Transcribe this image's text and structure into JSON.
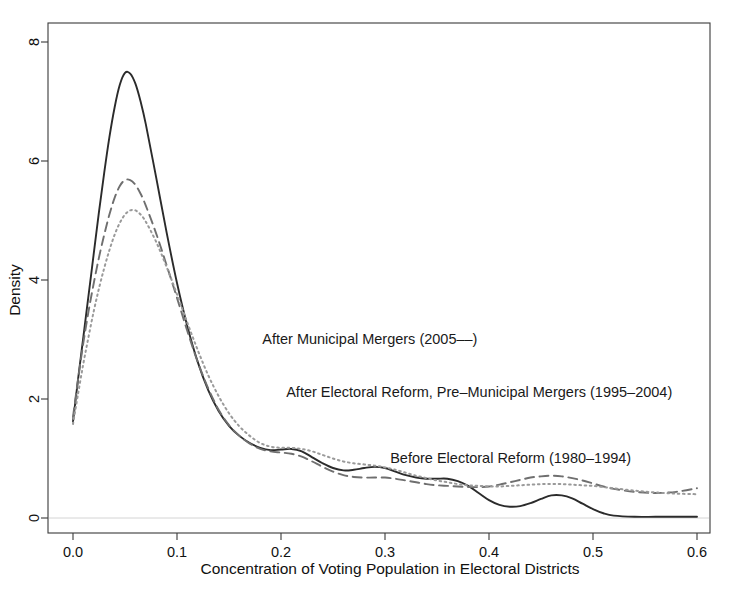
{
  "chart_data": {
    "type": "line",
    "title": "",
    "xlabel": "Concentration of Voting Population in Electoral Districts",
    "ylabel": "Density",
    "xlim": [
      0.0,
      0.6
    ],
    "ylim": [
      0.0,
      8.4
    ],
    "xticks": [
      0.0,
      0.1,
      0.2,
      0.3,
      0.4,
      0.5,
      0.6
    ],
    "xticklabels": [
      "0.0",
      "0.1",
      "0.2",
      "0.3",
      "0.4",
      "0.5",
      "0.6"
    ],
    "yticks": [
      0,
      2,
      4,
      6,
      8
    ],
    "yticklabels": [
      "0",
      "2",
      "4",
      "6",
      "8"
    ],
    "grid": false,
    "legend_position": "inline-annotations",
    "series": [
      {
        "name": "Before Electoral Reform (1980-1994)",
        "label": "Before Electoral Reform (1980–1994)",
        "linestyle": "solid",
        "color": "#2b2b2b",
        "label_color": "#1a1a1a",
        "label_x": 0.305,
        "label_y": 0.92,
        "x": [
          0.0,
          0.005,
          0.01,
          0.015,
          0.02,
          0.025,
          0.03,
          0.035,
          0.04,
          0.045,
          0.05,
          0.055,
          0.06,
          0.065,
          0.07,
          0.08,
          0.09,
          0.1,
          0.11,
          0.12,
          0.13,
          0.14,
          0.15,
          0.16,
          0.17,
          0.18,
          0.19,
          0.2,
          0.21,
          0.22,
          0.23,
          0.24,
          0.25,
          0.26,
          0.27,
          0.28,
          0.29,
          0.3,
          0.31,
          0.32,
          0.33,
          0.34,
          0.35,
          0.36,
          0.37,
          0.38,
          0.39,
          0.4,
          0.41,
          0.42,
          0.43,
          0.44,
          0.45,
          0.46,
          0.47,
          0.48,
          0.49,
          0.5,
          0.51,
          0.52,
          0.54,
          0.56,
          0.58,
          0.6
        ],
        "y": [
          1.62,
          2.35,
          3.05,
          3.75,
          4.45,
          5.15,
          5.8,
          6.4,
          6.9,
          7.28,
          7.48,
          7.47,
          7.3,
          7.0,
          6.62,
          5.72,
          4.8,
          3.95,
          3.22,
          2.62,
          2.15,
          1.8,
          1.55,
          1.38,
          1.26,
          1.18,
          1.14,
          1.15,
          1.16,
          1.12,
          1.02,
          0.92,
          0.84,
          0.8,
          0.81,
          0.84,
          0.86,
          0.84,
          0.78,
          0.72,
          0.68,
          0.66,
          0.66,
          0.66,
          0.62,
          0.54,
          0.42,
          0.3,
          0.22,
          0.19,
          0.2,
          0.25,
          0.32,
          0.38,
          0.38,
          0.33,
          0.24,
          0.15,
          0.08,
          0.04,
          0.02,
          0.02,
          0.02,
          0.02
        ]
      },
      {
        "name": "After Electoral Reform, Pre-Municipal Mergers (1995-2004)",
        "label": "After Electoral Reform, Pre–Municipal Mergers (1995–2004)",
        "linestyle": "dashed",
        "color": "#6f6f6f",
        "label_color": "#5a5a5a",
        "label_x": 0.205,
        "label_y": 2.03,
        "x": [
          0.0,
          0.005,
          0.01,
          0.015,
          0.02,
          0.025,
          0.03,
          0.035,
          0.04,
          0.045,
          0.05,
          0.055,
          0.06,
          0.065,
          0.07,
          0.08,
          0.09,
          0.1,
          0.11,
          0.12,
          0.13,
          0.14,
          0.15,
          0.16,
          0.17,
          0.18,
          0.19,
          0.2,
          0.21,
          0.22,
          0.23,
          0.24,
          0.25,
          0.26,
          0.27,
          0.28,
          0.29,
          0.3,
          0.31,
          0.32,
          0.33,
          0.34,
          0.35,
          0.36,
          0.37,
          0.38,
          0.39,
          0.4,
          0.41,
          0.42,
          0.43,
          0.44,
          0.45,
          0.46,
          0.47,
          0.48,
          0.49,
          0.5,
          0.51,
          0.52,
          0.54,
          0.56,
          0.58,
          0.6
        ],
        "y": [
          1.7,
          2.35,
          2.95,
          3.48,
          3.95,
          4.38,
          4.76,
          5.1,
          5.38,
          5.58,
          5.68,
          5.68,
          5.6,
          5.45,
          5.25,
          4.78,
          4.25,
          3.7,
          3.14,
          2.62,
          2.18,
          1.82,
          1.56,
          1.38,
          1.25,
          1.16,
          1.12,
          1.1,
          1.08,
          1.03,
          0.95,
          0.86,
          0.78,
          0.72,
          0.69,
          0.68,
          0.68,
          0.68,
          0.66,
          0.63,
          0.6,
          0.57,
          0.55,
          0.54,
          0.53,
          0.52,
          0.52,
          0.53,
          0.56,
          0.6,
          0.64,
          0.68,
          0.7,
          0.71,
          0.7,
          0.67,
          0.63,
          0.58,
          0.53,
          0.49,
          0.44,
          0.42,
          0.44,
          0.5
        ]
      },
      {
        "name": "After Municipal Mergers (2005-)",
        "label": "After Municipal Mergers (2005––)",
        "linestyle": "dotted",
        "color": "#9a9a9a",
        "label_color": "#9d9d9d",
        "label_x": 0.182,
        "label_y": 2.93,
        "x": [
          0.0,
          0.005,
          0.01,
          0.015,
          0.02,
          0.025,
          0.03,
          0.035,
          0.04,
          0.045,
          0.05,
          0.055,
          0.06,
          0.065,
          0.07,
          0.08,
          0.09,
          0.1,
          0.11,
          0.12,
          0.13,
          0.14,
          0.15,
          0.16,
          0.17,
          0.18,
          0.19,
          0.2,
          0.21,
          0.22,
          0.23,
          0.24,
          0.25,
          0.26,
          0.27,
          0.28,
          0.29,
          0.3,
          0.31,
          0.32,
          0.33,
          0.34,
          0.35,
          0.36,
          0.37,
          0.38,
          0.39,
          0.4,
          0.41,
          0.42,
          0.43,
          0.44,
          0.45,
          0.46,
          0.47,
          0.48,
          0.49,
          0.5,
          0.51,
          0.52,
          0.54,
          0.56,
          0.58,
          0.6
        ],
        "y": [
          1.58,
          2.1,
          2.6,
          3.05,
          3.48,
          3.86,
          4.2,
          4.5,
          4.76,
          4.96,
          5.1,
          5.17,
          5.17,
          5.1,
          4.98,
          4.64,
          4.22,
          3.76,
          3.28,
          2.82,
          2.4,
          2.05,
          1.76,
          1.54,
          1.38,
          1.26,
          1.2,
          1.18,
          1.18,
          1.16,
          1.12,
          1.06,
          1.0,
          0.95,
          0.92,
          0.9,
          0.88,
          0.85,
          0.81,
          0.76,
          0.71,
          0.67,
          0.63,
          0.6,
          0.57,
          0.55,
          0.54,
          0.53,
          0.53,
          0.54,
          0.55,
          0.56,
          0.57,
          0.57,
          0.57,
          0.56,
          0.55,
          0.54,
          0.52,
          0.5,
          0.46,
          0.43,
          0.41,
          0.4
        ]
      }
    ]
  }
}
